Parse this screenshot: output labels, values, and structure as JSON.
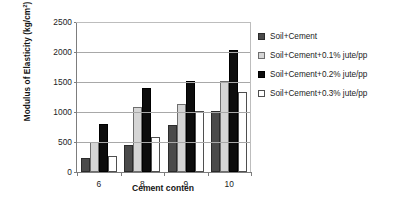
{
  "chart_data": {
    "type": "bar",
    "title": "",
    "xlabel": "Cement conten",
    "ylabel": "Modulus of Elasticity (kg/cm²)",
    "ylabel_main": "Modulus of Elasticity (kg/cm",
    "ylabel_sup": "2",
    "ylabel_tail": ")",
    "categories": [
      "6",
      "8",
      "9",
      "10"
    ],
    "ylim": [
      0,
      2500
    ],
    "yticks": [
      0,
      500,
      1000,
      1500,
      2000,
      2500
    ],
    "ytick_labels": [
      "0",
      "500",
      "1000",
      "1500",
      "2000",
      "2500"
    ],
    "grid": true,
    "grid_axis": "y",
    "legend_position": "right",
    "series": [
      {
        "name": "Soil+Cement",
        "color": "#4a4a4a",
        "values": [
          230,
          450,
          790,
          1020
        ]
      },
      {
        "name": "Soil+Cement+0.1% jute/pp",
        "color": "#d5d5d5",
        "values": [
          500,
          1080,
          1140,
          1520
        ]
      },
      {
        "name": "Soil+Cement+0.2% jute/pp",
        "color": "#0d0d0d",
        "values": [
          800,
          1400,
          1520,
          2030
        ]
      },
      {
        "name": "Soil+Cement+0.3% jute/pp",
        "color": "#ffffff",
        "values": [
          260,
          580,
          1010,
          1340
        ]
      }
    ]
  },
  "legend": {
    "items": [
      {
        "label": "Soil+Cement"
      },
      {
        "label": "Soil+Cement+0.1% jute/pp"
      },
      {
        "label": "Soil+Cement+0.2% jute/pp"
      },
      {
        "label": "Soil+Cement+0.3% jute/pp"
      }
    ]
  },
  "axes": {
    "x_title": "Cement conten",
    "y_ticks": [
      "2500",
      "2000",
      "1500",
      "1000",
      "500",
      "0"
    ],
    "x_ticks": [
      "6",
      "8",
      "9",
      "10"
    ]
  }
}
